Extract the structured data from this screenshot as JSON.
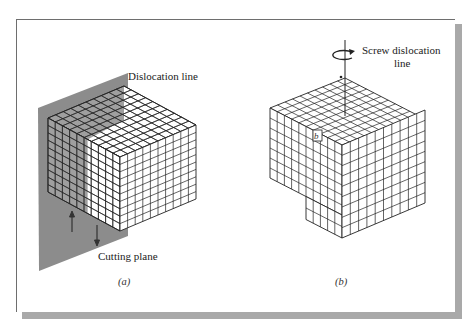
{
  "figure": {
    "panels": [
      {
        "id": "a",
        "caption": "(a)",
        "labels": {
          "dislocation_line": "Dislocation line",
          "cutting_plane": "Cutting plane"
        },
        "description": "Edge-on cube crystal lattice cut by a shaded cutting plane; shear arrows up and down on the plane"
      },
      {
        "id": "b",
        "caption": "(b)",
        "labels": {
          "screw_dislocation_line_1": "Screw dislocation",
          "screw_dislocation_line_2": "line",
          "burgers_vector": "b"
        },
        "description": "Cube lattice with a step offset showing a screw dislocation with Burgers vector b"
      }
    ],
    "colors": {
      "plane": "#8c8c8c",
      "plane_dark_face": "#6f6f6f",
      "grid_line": "#222222",
      "frame_border": "#6e6e6e",
      "shadow": "#a9a9a9"
    },
    "icons": {
      "up_arrow": "shear-up-arrow",
      "down_arrow": "shear-down-arrow",
      "rotation": "rotation-arrow"
    }
  }
}
